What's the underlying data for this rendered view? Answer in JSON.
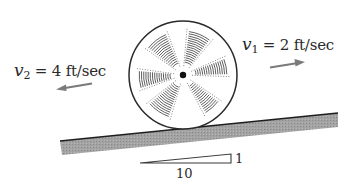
{
  "figure": {
    "velocities": {
      "left": {
        "symbol": "v",
        "subscript": "2",
        "equals": "=",
        "value": "4 ft/sec",
        "direction": "left"
      },
      "right": {
        "symbol": "v",
        "subscript": "1",
        "equals": "=",
        "value": "2 ft/sec",
        "direction": "right"
      }
    },
    "slope": {
      "rise_label": "1",
      "run_label": "10"
    },
    "colors": {
      "ink": "#2a2a2a",
      "incline_fill": "#9a9a9a",
      "arrow": "#777777",
      "hatch": "#555555"
    }
  }
}
